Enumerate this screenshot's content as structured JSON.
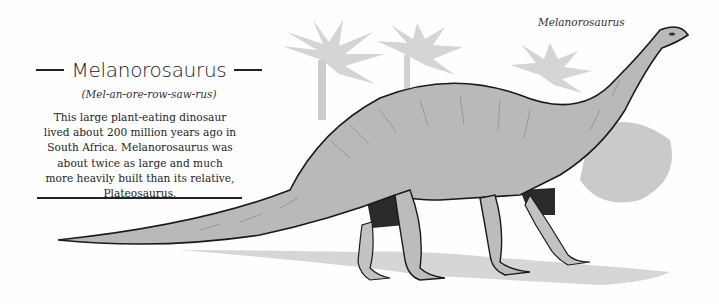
{
  "header": {
    "title": "Melanorosaurus",
    "pronunciation": "(Mel-an-ore-row-saw-rus)"
  },
  "description": {
    "lines": [
      "This large plant-eating dinosaur",
      "lived about 200 million years ago in",
      "South Africa. Melanorosaurus was",
      "about twice as large and much",
      "more heavily built than its relative,",
      "Plateosaurus."
    ]
  },
  "illustration": {
    "caption": "Melanorosaurus",
    "subject": "Melanorosaurus dinosaur walking with palm trees in background",
    "colors": {
      "ink": "#1a1a1a",
      "skin": "#b8b8b8",
      "skin_dark": "#7a7a7a",
      "shadow": "#2a2a2a",
      "foliage": "#c9c9c9",
      "ground": "#bdbdbd"
    }
  }
}
